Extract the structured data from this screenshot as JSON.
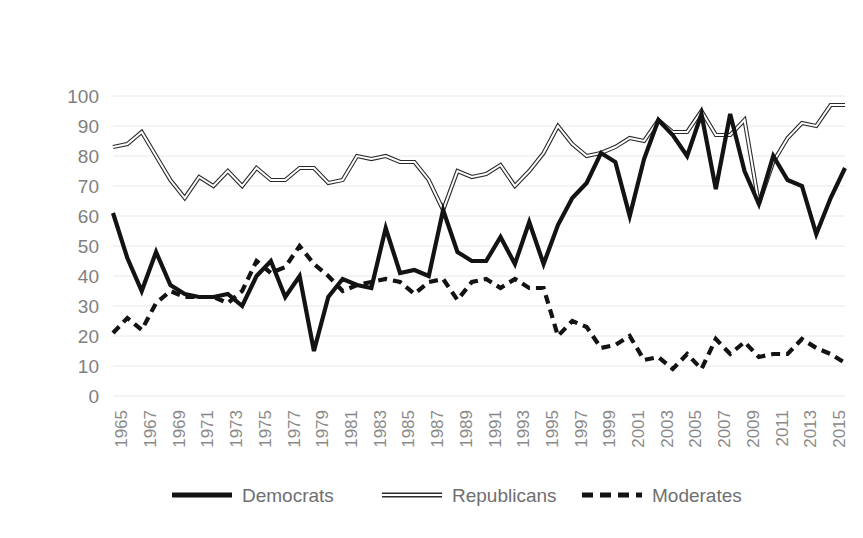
{
  "chart_data": {
    "type": "line",
    "title": "",
    "subtitle": "",
    "xlabel": "",
    "ylabel": "",
    "ylim": [
      0,
      100
    ],
    "ytick_labels": [
      "100",
      "90",
      "80",
      "70",
      "60",
      "50",
      "40",
      "30",
      "20",
      "10",
      "0"
    ],
    "ytick_values": [
      100,
      90,
      80,
      70,
      60,
      50,
      40,
      30,
      20,
      10,
      0
    ],
    "grid": true,
    "legend_position": "bottom",
    "xlim": [
      1964,
      2015
    ],
    "x": [
      1964,
      1965,
      1966,
      1967,
      1968,
      1969,
      1970,
      1971,
      1972,
      1973,
      1974,
      1975,
      1976,
      1977,
      1978,
      1979,
      1980,
      1981,
      1982,
      1983,
      1984,
      1985,
      1986,
      1987,
      1988,
      1989,
      1990,
      1991,
      1992,
      1993,
      1994,
      1995,
      1996,
      1997,
      1998,
      1999,
      2000,
      2001,
      2002,
      2003,
      2004,
      2005,
      2006,
      2007,
      2008,
      2009,
      2010,
      2011,
      2012,
      2013,
      2014,
      2015
    ],
    "xtick_labels": [
      "1965",
      "1967",
      "1969",
      "1971",
      "1973",
      "1975",
      "1977",
      "1979",
      "1981",
      "1983",
      "1985",
      "1987",
      "1989",
      "1991",
      "1993",
      "1995",
      "1997",
      "1999",
      "2001",
      "2003",
      "2005",
      "2007",
      "2009",
      "2011",
      "2013",
      "2015"
    ],
    "xtick_values": [
      1965,
      1967,
      1969,
      1971,
      1973,
      1975,
      1977,
      1979,
      1981,
      1983,
      1985,
      1987,
      1989,
      1991,
      1993,
      1995,
      1997,
      1999,
      2001,
      2003,
      2005,
      2007,
      2009,
      2011,
      2013,
      2015
    ],
    "series": [
      {
        "name": "Democrats",
        "style": "solid-thick",
        "color": "#131313",
        "values": [
          61,
          46,
          35,
          48,
          37,
          34,
          33,
          33,
          34,
          30,
          40,
          45,
          33,
          40,
          15,
          33,
          39,
          37,
          36,
          56,
          41,
          42,
          40,
          62,
          48,
          45,
          45,
          53,
          44,
          58,
          44,
          57,
          66,
          71,
          81,
          78,
          60,
          79,
          92,
          87,
          80,
          94,
          69,
          94,
          75,
          64,
          80,
          72,
          70,
          54,
          66,
          76
        ]
      },
      {
        "name": "Republicans",
        "style": "hollow-line",
        "color": "#2a2a2a",
        "values": [
          83,
          84,
          88,
          80,
          72,
          66,
          73,
          70,
          75,
          70,
          76,
          72,
          72,
          76,
          76,
          71,
          72,
          80,
          79,
          80,
          78,
          78,
          72,
          62,
          75,
          73,
          74,
          77,
          70,
          75,
          81,
          90,
          84,
          80,
          81,
          83,
          86,
          85,
          92,
          88,
          88,
          95,
          87,
          87,
          92,
          64,
          78,
          86,
          91,
          90,
          97,
          97
        ]
      },
      {
        "name": "Moderates",
        "style": "dashed",
        "color": "#131313",
        "values": [
          21,
          26,
          22,
          31,
          35,
          33,
          33,
          33,
          31,
          35,
          45,
          41,
          43,
          50,
          44,
          40,
          35,
          37,
          38,
          39,
          38,
          34,
          38,
          39,
          32,
          38,
          39,
          36,
          39,
          36,
          36,
          20,
          25,
          23,
          16,
          17,
          20,
          12,
          13,
          9,
          14,
          9,
          19,
          14,
          18,
          13,
          14,
          14,
          19,
          16,
          14,
          11
        ]
      }
    ]
  },
  "legend": {
    "items": [
      {
        "label": "Democrats",
        "key": "dem"
      },
      {
        "label": "Republicans",
        "key": "rep"
      },
      {
        "label": "Moderates",
        "key": "mod"
      }
    ]
  }
}
